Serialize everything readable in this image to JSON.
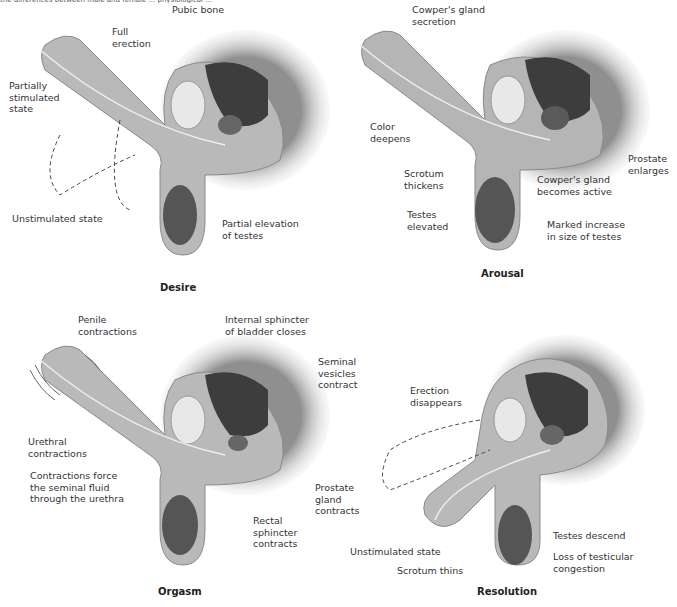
{
  "caption_fragment": "the differences between male and female ... physiological ...",
  "colors": {
    "tissue": "#b9b9b9",
    "tissue_edge": "#8a8a8a",
    "shadow_bg": "#9a9a9a",
    "bladder": "#3d3d3d",
    "testis": "#555555",
    "bone": "#e8e8e8",
    "text": "#333333"
  },
  "panels": [
    {
      "title": "Desire",
      "labels": [
        "Pubic bone",
        "Full\nerection",
        "Partially\nstimulated\nstate",
        "Unstimulated state",
        "Partial elevation\nof testes"
      ]
    },
    {
      "title": "Arousal",
      "labels": [
        "Cowper's gland\nsecretion",
        "Color\ndeepens",
        "Scrotum\nthickens",
        "Testes\nelevated",
        "Cowper's gland\nbecomes active",
        "Prostate\nenlarges",
        "Marked increase\nin size of testes"
      ]
    },
    {
      "title": "Orgasm",
      "labels": [
        "Penile\ncontractions",
        "Internal sphincter\nof bladder closes",
        "Seminal\nvesicles\ncontract",
        "Urethral\ncontractions",
        "Contractions force\nthe seminal fluid\nthrough the urethra",
        "Prostate\ngland\ncontracts",
        "Rectal\nsphincter\ncontracts"
      ]
    },
    {
      "title": "Resolution",
      "labels": [
        "Erection\ndisappears",
        "Unstimulated state",
        "Scrotum thins",
        "Testes descend",
        "Loss of testicular\ncongestion"
      ]
    }
  ]
}
